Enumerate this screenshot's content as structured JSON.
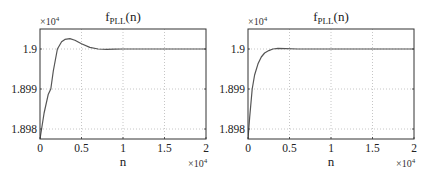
{
  "chart_data": [
    {
      "type": "line",
      "title": "f_PLL(n)",
      "title_main": "f",
      "title_sub": "PLL",
      "title_tail": "(n)",
      "xlabel": "n",
      "ylabel": "",
      "x_multiplier": "×10^4",
      "y_multiplier": "×10^4",
      "x_multiplier_base": "×10",
      "x_multiplier_exp": "4",
      "y_multiplier_base": "×10",
      "y_multiplier_exp": "4",
      "xlim": [
        0,
        20000
      ],
      "ylim": [
        18977.5,
        19005
      ],
      "x_ticks": [
        0,
        0.5,
        1,
        1.5,
        2
      ],
      "x_tick_labels": [
        "0",
        "0.5",
        "1",
        "1.5",
        "2"
      ],
      "y_ticks": [
        1.898,
        1.899,
        1.9
      ],
      "y_tick_labels": [
        "1.898",
        "1.899",
        "1.9"
      ],
      "grid": true,
      "series": [
        {
          "name": "f_PLL(n)",
          "x": [
            0,
            500,
            1000,
            1300,
            1600,
            2100,
            2600,
            3000,
            3600,
            4200,
            5000,
            6000,
            7000,
            8000,
            9000,
            10000,
            12000,
            15000,
            20000
          ],
          "y": [
            18977.5,
            18984.0,
            18988.7,
            18990.0,
            18994.5,
            19000.0,
            19001.8,
            19002.4,
            19002.6,
            19002.2,
            19001.3,
            19000.4,
            19000.0,
            18999.9,
            18999.95,
            19000.0,
            19000.0,
            19000.0,
            19000.0
          ]
        }
      ]
    },
    {
      "type": "line",
      "title": "f_PLL(n)",
      "title_main": "f",
      "title_sub": "PLL",
      "title_tail": "(n)",
      "xlabel": "n",
      "ylabel": "",
      "x_multiplier": "×10^4",
      "y_multiplier": "×10^4",
      "x_multiplier_base": "×10",
      "x_multiplier_exp": "4",
      "y_multiplier_base": "×10",
      "y_multiplier_exp": "4",
      "xlim": [
        0,
        20000
      ],
      "ylim": [
        18977.5,
        19005
      ],
      "x_ticks": [
        0,
        0.5,
        1,
        1.5,
        2
      ],
      "x_tick_labels": [
        "0",
        "0.5",
        "1",
        "1.5",
        "2"
      ],
      "y_ticks": [
        1.898,
        1.899,
        1.9
      ],
      "y_tick_labels": [
        "1.898",
        "1.899",
        "1.9"
      ],
      "grid": true,
      "series": [
        {
          "name": "f_PLL(n)",
          "x": [
            0,
            200,
            500,
            800,
            1200,
            1600,
            2000,
            2500,
            3000,
            3600,
            4500,
            6000,
            8000,
            10000,
            15000,
            20000
          ],
          "y": [
            18977.5,
            18983.0,
            18990.0,
            18993.5,
            18996.3,
            18998.0,
            18999.0,
            18999.6,
            19000.0,
            19000.15,
            19000.1,
            19000.0,
            19000.0,
            19000.0,
            19000.0,
            19000.0
          ]
        }
      ]
    }
  ]
}
